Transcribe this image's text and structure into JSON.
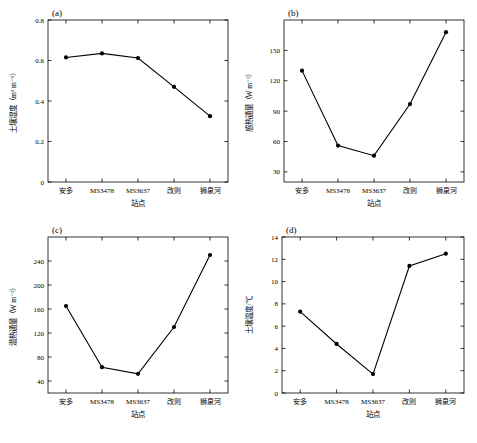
{
  "figure": {
    "width": 477,
    "height": 443,
    "background": "#ffffff",
    "line_color": "#000000",
    "marker": "filled-circle"
  },
  "categories": [
    "安多",
    "MS3478",
    "MS3637",
    "改则",
    "狮泉河"
  ],
  "chart_data": [
    {
      "type": "line",
      "panel_label": "(a)",
      "title": "",
      "xlabel": "站点",
      "ylabel": "土壤湿度（m³ m⁻³）",
      "categories": [
        "安多",
        "MS3478",
        "MS3637",
        "改则",
        "狮泉河"
      ],
      "values": [
        0.615,
        0.635,
        0.612,
        0.47,
        0.325
      ],
      "ylim": [
        0,
        0.8
      ],
      "yticks": [
        0,
        0.2,
        0.4,
        0.6,
        0.8
      ],
      "grid": false,
      "legend": "none"
    },
    {
      "type": "line",
      "panel_label": "(b)",
      "title": "",
      "xlabel": "站点",
      "ylabel": "感热通量（W m⁻²）",
      "categories": [
        "安多",
        "MS3478",
        "MS3637",
        "改则",
        "狮泉河"
      ],
      "values": [
        130,
        56,
        46,
        97,
        168
      ],
      "ylim": [
        20,
        180
      ],
      "yticks": [
        30,
        60,
        90,
        120,
        150
      ],
      "grid": false,
      "legend": "none"
    },
    {
      "type": "line",
      "panel_label": "(c)",
      "title": "",
      "xlabel": "站点",
      "ylabel": "潜热通量（W m⁻²）",
      "categories": [
        "安多",
        "MS3478",
        "MS3637",
        "改则",
        "狮泉河"
      ],
      "values": [
        165,
        63,
        52,
        130,
        250
      ],
      "ylim": [
        20,
        280
      ],
      "yticks": [
        40,
        80,
        120,
        160,
        200,
        240
      ],
      "grid": false,
      "legend": "none"
    },
    {
      "type": "line",
      "panel_label": "(d)",
      "title": "",
      "xlabel": "站点",
      "ylabel": "土壤温度/℃",
      "categories": [
        "安多",
        "MS3478",
        "MS3637",
        "改则",
        "狮泉河"
      ],
      "values": [
        7.3,
        4.4,
        1.7,
        11.4,
        12.5
      ],
      "ylim": [
        0,
        14
      ],
      "yticks": [
        0,
        2,
        4,
        6,
        8,
        10,
        12,
        14
      ],
      "grid": false,
      "legend": "none"
    }
  ]
}
